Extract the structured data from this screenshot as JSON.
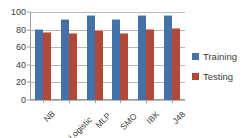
{
  "chart_data": {
    "type": "bar",
    "title": "",
    "subtitle": "",
    "xlabel": "",
    "ylabel": "",
    "categories": [
      "NB",
      "Logistic",
      "MLP",
      "SMO",
      "IBK",
      "J48"
    ],
    "series": [
      {
        "name": "Training",
        "color": "#4472a8",
        "values": [
          80,
          91,
          95,
          91,
          95,
          95
        ]
      },
      {
        "name": "Testing",
        "color": "#b0493a",
        "values": [
          76,
          75,
          78,
          75,
          80,
          81
        ]
      }
    ],
    "ylim": [
      0,
      100
    ],
    "yticks": [
      0,
      20,
      40,
      60,
      80,
      100
    ],
    "ytick_labels": [
      "0",
      "20",
      "40",
      "60",
      "80",
      "100"
    ],
    "grid": true,
    "grid_axis": "y",
    "legend_position": "right",
    "legend_entries": [
      "Training",
      "Testing"
    ],
    "annotations": [],
    "xtick_rotation": -45
  },
  "colors": {
    "training": "#4472a8",
    "testing": "#b0493a",
    "gridline": "#b7b7b7",
    "axis": "#9a9a9a",
    "text": "#3b3b3b",
    "background": "#ffffff"
  }
}
